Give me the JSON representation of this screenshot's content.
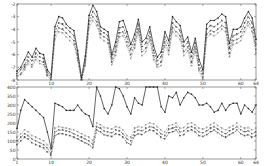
{
  "chart_data": [
    {
      "type": "line",
      "title": "",
      "xlabel": "",
      "ylabel": "",
      "xlim": [
        1,
        64
      ],
      "ylim": [
        -8,
        -2
      ],
      "x_ticks": [
        1,
        10,
        20,
        30,
        40,
        50,
        60,
        64
      ],
      "y_ticks": [
        -2,
        -3,
        -4,
        -5,
        -6,
        -7,
        -8
      ],
      "grid": false,
      "legend": null,
      "x": [
        1,
        2,
        3,
        4,
        5,
        6,
        7,
        8,
        9,
        10,
        11,
        12,
        13,
        14,
        15,
        16,
        17,
        18,
        19,
        20,
        21,
        22,
        23,
        24,
        25,
        26,
        27,
        28,
        29,
        30,
        31,
        32,
        33,
        34,
        35,
        36,
        37,
        38,
        39,
        40,
        41,
        42,
        42,
        44,
        45,
        46,
        47,
        48,
        49,
        50,
        51,
        52,
        53,
        54,
        55,
        56,
        57,
        58,
        59,
        60,
        61,
        62,
        63,
        64
      ],
      "series": [
        {
          "name": "series-1",
          "style": "solid-dot",
          "color": "#222222",
          "values": [
            -7.3,
            -7.0,
            -6.4,
            -5.8,
            -6.2,
            -5.5,
            -5.9,
            -6.0,
            -7.2,
            -7.6,
            -3.8,
            -3.0,
            -3.1,
            -3.6,
            -3.9,
            -4.1,
            -5.7,
            -7.8,
            -6.1,
            -2.9,
            -2.1,
            -2.6,
            -3.8,
            -4.0,
            -4.2,
            -6.0,
            -5.0,
            -3.4,
            -3.3,
            -4.2,
            -5.2,
            -4.4,
            -3.2,
            -5.0,
            -4.7,
            -3.8,
            -5.3,
            -6.2,
            -5.8,
            -4.2,
            -4.9,
            -3.0,
            -3.4,
            -3.7,
            -5.0,
            -4.6,
            -5.8,
            -4.7,
            -6.4,
            -7.2,
            -3.6,
            -3.3,
            -3.3,
            -3.1,
            -2.8,
            -3.0,
            -5.1,
            -4.0,
            -4.0,
            -3.8,
            -3.1,
            -2.6,
            -3.1,
            -4.8
          ]
        },
        {
          "name": "series-2",
          "style": "dash",
          "color": "#444444",
          "values": [
            -7.5,
            -7.2,
            -6.8,
            -6.2,
            -6.5,
            -5.9,
            -6.2,
            -6.3,
            -7.4,
            -7.8,
            -4.2,
            -3.5,
            -3.6,
            -3.9,
            -4.2,
            -4.5,
            -6.0,
            -8.0,
            -6.4,
            -3.3,
            -2.6,
            -3.0,
            -4.1,
            -4.3,
            -4.5,
            -6.3,
            -5.4,
            -3.9,
            -3.8,
            -4.6,
            -5.6,
            -4.8,
            -3.6,
            -5.4,
            -5.1,
            -4.2,
            -5.7,
            -6.5,
            -6.2,
            -4.6,
            -5.3,
            -3.5,
            -3.8,
            -4.1,
            -5.4,
            -5.0,
            -6.2,
            -5.1,
            -6.8,
            -7.5,
            -4.0,
            -3.7,
            -3.8,
            -3.6,
            -3.3,
            -3.5,
            -5.5,
            -4.5,
            -4.4,
            -4.2,
            -3.5,
            -3.0,
            -3.5,
            -5.2
          ]
        },
        {
          "name": "series-3",
          "style": "dashdot",
          "color": "#555555",
          "values": [
            -7.7,
            -7.5,
            -7.0,
            -6.5,
            -6.8,
            -6.2,
            -6.5,
            -6.6,
            -7.6,
            -8.0,
            -4.5,
            -3.9,
            -4.0,
            -4.3,
            -4.6,
            -4.9,
            -6.3,
            -8.1,
            -6.7,
            -3.6,
            -3.0,
            -3.4,
            -4.4,
            -4.6,
            -4.8,
            -6.6,
            -5.8,
            -4.3,
            -4.2,
            -5.0,
            -6.0,
            -5.2,
            -4.0,
            -5.8,
            -5.5,
            -4.6,
            -6.1,
            -6.8,
            -6.6,
            -5.0,
            -5.7,
            -3.9,
            -4.2,
            -4.5,
            -5.8,
            -5.4,
            -6.6,
            -5.5,
            -7.1,
            -7.8,
            -4.4,
            -4.1,
            -4.2,
            -4.0,
            -3.7,
            -3.9,
            -5.9,
            -4.9,
            -4.8,
            -4.6,
            -3.9,
            -3.4,
            -3.9,
            -5.6
          ]
        },
        {
          "name": "series-4",
          "style": "dot",
          "color": "#888888",
          "values": [
            -7.8,
            -7.6,
            -7.2,
            -6.7,
            -7.0,
            -6.4,
            -6.7,
            -6.8,
            -7.7,
            -8.0,
            -4.8,
            -4.2,
            -4.3,
            -4.6,
            -4.9,
            -5.2,
            -6.5,
            -8.1,
            -6.9,
            -3.9,
            -3.3,
            -3.7,
            -4.7,
            -4.9,
            -5.1,
            -6.8,
            -6.1,
            -4.6,
            -4.5,
            -5.3,
            -6.3,
            -5.5,
            -4.3,
            -6.1,
            -5.8,
            -4.9,
            -6.4,
            -7.0,
            -6.9,
            -5.3,
            -6.0,
            -4.2,
            -4.5,
            -4.8,
            -6.1,
            -5.7,
            -6.9,
            -5.8,
            -7.3,
            -8.0,
            -4.7,
            -4.4,
            -4.5,
            -4.3,
            -4.0,
            -4.2,
            -6.2,
            -5.2,
            -5.1,
            -4.9,
            -4.2,
            -3.7,
            -4.2,
            -5.9
          ]
        }
      ]
    },
    {
      "type": "line",
      "title": "",
      "xlabel": "",
      "ylabel": "",
      "xlim": [
        1,
        64
      ],
      "ylim": [
        0,
        400
      ],
      "x_ticks": [
        1,
        10,
        20,
        30,
        40,
        50,
        60,
        64
      ],
      "y_ticks": [
        0,
        50,
        100,
        150,
        200,
        250,
        300,
        350,
        400
      ],
      "grid": false,
      "legend": null,
      "series": [
        {
          "name": "series-1",
          "style": "solid-dot",
          "color": "#222222",
          "values": [
            170,
            270,
            330,
            310,
            290,
            270,
            250,
            230,
            150,
            60,
            310,
            300,
            290,
            270,
            270,
            270,
            300,
            270,
            250,
            240,
            180,
            420,
            350,
            280,
            250,
            300,
            400,
            390,
            350,
            290,
            250,
            340,
            310,
            300,
            430,
            410,
            400,
            420,
            290,
            260,
            350,
            340,
            370,
            300,
            340,
            370,
            360,
            340,
            300,
            300,
            310,
            290,
            260,
            270,
            310,
            270,
            300,
            310,
            310,
            250,
            300,
            280,
            260,
            300
          ]
        },
        {
          "name": "series-2",
          "style": "dot",
          "color": "#888888",
          "values": [
            120,
            140,
            160,
            150,
            130,
            120,
            110,
            100,
            80,
            50,
            170,
            180,
            175,
            170,
            165,
            160,
            150,
            140,
            130,
            120,
            100,
            200,
            190,
            175,
            170,
            165,
            180,
            175,
            160,
            130,
            120,
            170,
            180,
            175,
            190,
            200,
            195,
            180,
            160,
            150,
            185,
            190,
            200,
            170,
            175,
            195,
            200,
            190,
            170,
            165,
            175,
            190,
            200,
            185,
            170,
            160,
            175,
            185,
            200,
            180,
            170,
            175,
            160,
            170
          ]
        },
        {
          "name": "series-3",
          "style": "dash",
          "color": "#555555",
          "values": [
            100,
            120,
            140,
            130,
            110,
            100,
            90,
            80,
            60,
            30,
            150,
            160,
            160,
            155,
            150,
            140,
            130,
            120,
            110,
            100,
            80,
            180,
            170,
            155,
            150,
            145,
            160,
            155,
            140,
            110,
            100,
            150,
            160,
            155,
            170,
            180,
            175,
            160,
            140,
            130,
            165,
            170,
            180,
            150,
            155,
            175,
            180,
            170,
            150,
            145,
            155,
            170,
            180,
            165,
            150,
            140,
            155,
            165,
            180,
            160,
            150,
            155,
            140,
            150
          ]
        },
        {
          "name": "series-4",
          "style": "dashdot",
          "color": "#444444",
          "values": [
            80,
            100,
            120,
            110,
            90,
            80,
            70,
            60,
            40,
            20,
            130,
            140,
            140,
            135,
            130,
            120,
            110,
            100,
            90,
            80,
            60,
            160,
            150,
            135,
            130,
            125,
            140,
            135,
            120,
            90,
            80,
            130,
            140,
            135,
            150,
            160,
            155,
            140,
            120,
            110,
            145,
            150,
            160,
            130,
            135,
            155,
            160,
            150,
            130,
            125,
            135,
            150,
            160,
            145,
            130,
            120,
            135,
            145,
            160,
            140,
            130,
            135,
            120,
            130
          ]
        }
      ]
    }
  ]
}
